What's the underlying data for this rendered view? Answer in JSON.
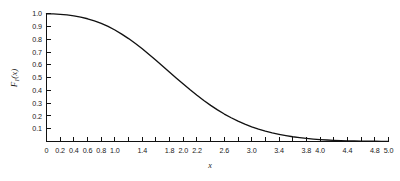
{
  "figure": {
    "background_color": "#ffffff",
    "ink_color": "#111111"
  },
  "chart_data": {
    "type": "line",
    "title": "",
    "subtitle": "",
    "xlabel": "x",
    "ylabel": "F₁(x)",
    "ylabel_base": "F",
    "ylabel_subscript": "1",
    "ylabel_arg": "(x)",
    "xlim": [
      0,
      5.0
    ],
    "ylim": [
      0,
      1.0
    ],
    "grid": false,
    "legend": null,
    "legend_position": "none",
    "line_color": "#111111",
    "x_tick_values": [
      0,
      0.2,
      0.4,
      0.6,
      0.8,
      1.0,
      1.2,
      1.4,
      1.6,
      1.8,
      2.0,
      2.2,
      2.4,
      2.6,
      2.8,
      3.0,
      3.2,
      3.4,
      3.6,
      3.8,
      4.0,
      4.2,
      4.4,
      4.6,
      4.8,
      5.0
    ],
    "x_labeled_ticks": [
      {
        "value": 0,
        "label": "0"
      },
      {
        "value": 0.2,
        "label": "0.2"
      },
      {
        "value": 0.4,
        "label": "0.4"
      },
      {
        "value": 0.6,
        "label": "0.6"
      },
      {
        "value": 0.8,
        "label": "0.8"
      },
      {
        "value": 1.0,
        "label": "1.0"
      },
      {
        "value": 1.4,
        "label": "1.4"
      },
      {
        "value": 1.8,
        "label": "1.8"
      },
      {
        "value": 2.0,
        "label": "2.0"
      },
      {
        "value": 2.2,
        "label": "2.2"
      },
      {
        "value": 2.6,
        "label": "2.6"
      },
      {
        "value": 3.0,
        "label": "3.0"
      },
      {
        "value": 3.4,
        "label": "3.4"
      },
      {
        "value": 3.8,
        "label": "3.8"
      },
      {
        "value": 4.0,
        "label": "4.0"
      },
      {
        "value": 4.4,
        "label": "4.4"
      },
      {
        "value": 4.8,
        "label": "4.8"
      },
      {
        "value": 5.0,
        "label": "5.0"
      }
    ],
    "y_tick_values": [
      0,
      0.1,
      0.2,
      0.3,
      0.4,
      0.5,
      0.6,
      0.7,
      0.8,
      0.9,
      1.0
    ],
    "y_labeled_ticks": [
      {
        "value": 0.1,
        "label": "0.1"
      },
      {
        "value": 0.2,
        "label": "0.2"
      },
      {
        "value": 0.3,
        "label": "0.3"
      },
      {
        "value": 0.4,
        "label": "0.4"
      },
      {
        "value": 0.5,
        "label": "0.5"
      },
      {
        "value": 0.6,
        "label": "0.6"
      },
      {
        "value": 0.7,
        "label": "0.7"
      },
      {
        "value": 0.8,
        "label": "0.8"
      },
      {
        "value": 0.9,
        "label": "0.9"
      },
      {
        "value": 1.0,
        "label": "1.0"
      }
    ],
    "x": [
      0.0,
      0.1,
      0.2,
      0.3,
      0.4,
      0.5,
      0.6,
      0.7,
      0.8,
      0.9,
      1.0,
      1.1,
      1.2,
      1.3,
      1.4,
      1.5,
      1.6,
      1.7,
      1.8,
      1.9,
      2.0,
      2.1,
      2.2,
      2.3,
      2.4,
      2.5,
      2.6,
      2.7,
      2.8,
      2.9,
      3.0,
      3.1,
      3.2,
      3.3,
      3.4,
      3.5,
      3.6,
      3.7,
      3.8,
      3.9,
      4.0,
      4.1,
      4.2,
      4.3,
      4.4,
      4.5,
      4.6,
      4.7,
      4.8,
      4.9,
      5.0
    ],
    "y": [
      1.0,
      0.999,
      0.996,
      0.991,
      0.984,
      0.974,
      0.961,
      0.945,
      0.925,
      0.901,
      0.873,
      0.841,
      0.806,
      0.767,
      0.726,
      0.682,
      0.637,
      0.59,
      0.543,
      0.496,
      0.45,
      0.405,
      0.362,
      0.321,
      0.283,
      0.248,
      0.215,
      0.186,
      0.159,
      0.136,
      0.115,
      0.097,
      0.081,
      0.067,
      0.056,
      0.046,
      0.037,
      0.03,
      0.024,
      0.019,
      0.015,
      0.012,
      0.009,
      0.007,
      0.005,
      0.004,
      0.003,
      0.002,
      0.002,
      0.001,
      0.001
    ]
  }
}
